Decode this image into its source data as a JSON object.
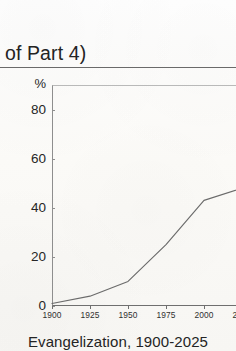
{
  "page": {
    "running_head": "t of Part 4)",
    "paper_color": "#fbfaf8",
    "ink_color": "#2b2b2b"
  },
  "figure": {
    "caption": "Evangelization, 1900-2025",
    "y_unit_label": "%",
    "line_color": "#6b6b6b",
    "axis_color": "#6f6f6f"
  },
  "chart_data": {
    "type": "line",
    "title": "Evangelization, 1900-2025",
    "xlabel": "",
    "ylabel": "%",
    "x": [
      1900,
      1925,
      1950,
      1975,
      2000,
      2025
    ],
    "values": [
      1,
      4,
      10,
      25,
      43,
      48
    ],
    "series": [
      {
        "name": "Evangelization",
        "values": [
          1,
          4,
          10,
          25,
          43,
          48
        ]
      }
    ],
    "xlim": [
      1900,
      2025
    ],
    "ylim": [
      0,
      90
    ],
    "x_ticks": [
      1900,
      1925,
      1950,
      1975,
      2000,
      2025
    ],
    "x_tick_labels": [
      "1900",
      "1925",
      "1950",
      "1975",
      "2000",
      "2025"
    ],
    "y_ticks": [
      0,
      20,
      40,
      60,
      80
    ],
    "y_tick_labels": [
      "0",
      "20",
      "40",
      "60",
      "80"
    ],
    "grid": false,
    "legend": false,
    "legend_position": "none",
    "annotations": []
  }
}
